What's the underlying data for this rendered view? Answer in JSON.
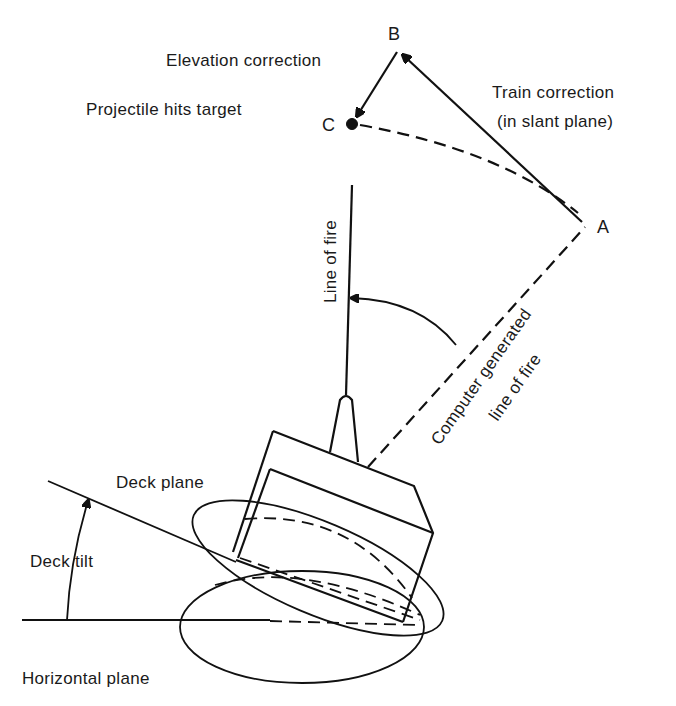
{
  "diagram": {
    "type": "gun fire-control geometry on tilted deck",
    "points": {
      "A": "A",
      "B": "B",
      "C": "C"
    },
    "labels": {
      "elevation_correction": "Elevation correction",
      "projectile_hits_target": "Projectile hits target",
      "train_correction_line1": "Train correction",
      "train_correction_line2": "(in slant plane)",
      "line_of_fire": "Line of fire",
      "computer_line1": "Computer generated",
      "computer_line2": "line of fire",
      "deck_plane": "Deck plane",
      "deck_tilt": "Deck tilt",
      "horizontal_plane": "Horizontal plane"
    },
    "colors": {
      "ink": "#111111",
      "background": "#ffffff"
    }
  }
}
